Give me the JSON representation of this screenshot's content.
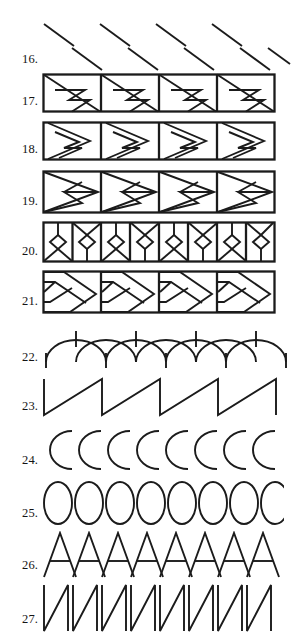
{
  "page": {
    "kind": "pattern-exercise-sheet",
    "background_color": "#ffffff",
    "ink_color": "#1b1b1b",
    "width": 291,
    "height": 638
  },
  "rows": [
    {
      "number": "16.",
      "name": "diagonal-strokes",
      "description": "Two staggered rows of short parallel diagonal strokes slanting down-right",
      "top_strokes": 4,
      "bottom_strokes": 5,
      "framed": false
    },
    {
      "number": "17.",
      "name": "rectangle-zigzag-band",
      "description": "Band of rectangles, each with a full diagonal and an inner zigzag arrow",
      "cells": 4,
      "framed": true
    },
    {
      "number": "18.",
      "name": "right-triangle-zigzag-band",
      "description": "Band of rectangles each containing a right-pointing triangle with an inner zigzag notch",
      "cells": 4,
      "framed": true
    },
    {
      "number": "19.",
      "name": "crossed-triangle-band",
      "description": "Band of rectangles each with crossing triangles forming a central diamond",
      "cells": 4,
      "framed": true
    },
    {
      "number": "20.",
      "name": "diamond-x-alternating-band",
      "description": "Band of narrow cells alternating diamond-with-X-below and diamond-with-X-above",
      "cells": 8,
      "framed": true
    },
    {
      "number": "21.",
      "name": "herringbone-chevron-band",
      "description": "Band of rectangles with nested chevron / herringbone diagonals",
      "cells": 4,
      "framed": true
    },
    {
      "number": "22.",
      "name": "overlapping-arcs-row",
      "description": "Row of overlapping semicircular arcs with short vertical tick marks at the crossings",
      "units": 5,
      "framed": false
    },
    {
      "number": "23.",
      "name": "sawtooth-row",
      "description": "Sawtooth wave: vertical rise then long diagonal fall",
      "units": 4,
      "framed": false
    },
    {
      "number": "24.",
      "name": "c-arc-row",
      "description": "Row of eight backward C arcs",
      "units": 8,
      "framed": false
    },
    {
      "number": "25.",
      "name": "ellipse-row",
      "description": "Row of eight tall ellipses",
      "units": 8,
      "framed": false
    },
    {
      "number": "26.",
      "name": "letter-a-row",
      "description": "Row of eight overlapping letter-A shapes with crossbars",
      "units": 8,
      "framed": false
    },
    {
      "number": "27.",
      "name": "letter-n-row",
      "description": "Row of eight letter-N shapes, vertical stroke, diagonal, vertical stroke",
      "units": 8,
      "framed": false
    }
  ]
}
